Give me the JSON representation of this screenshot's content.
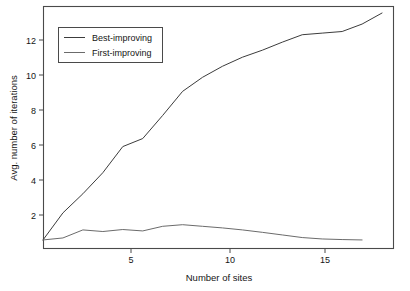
{
  "chart_data": {
    "type": "line",
    "title": "",
    "subtitle": "",
    "xlabel": "Number of sites",
    "ylabel": "Avg. number of iterations",
    "xlim": [
      1,
      18.6
    ],
    "ylim": [
      1.55,
      13.65
    ],
    "xticks": [
      5,
      10,
      15
    ],
    "xticklabels": [
      "5",
      "10",
      "15"
    ],
    "yticks": [
      2,
      4,
      6,
      8,
      10,
      12
    ],
    "yticklabels": [
      "2",
      "4",
      "6",
      "8",
      "10",
      "12"
    ],
    "grid": false,
    "legend_position": "upper left",
    "frame": "box",
    "series": [
      {
        "name": "Best-improving",
        "color": "#3c3c3c",
        "x": [
          1,
          2,
          3,
          4,
          5,
          6,
          7,
          8,
          9,
          10,
          11,
          12,
          13,
          14,
          15,
          16,
          17,
          18
        ],
        "values": [
          2.0,
          3.35,
          4.3,
          5.35,
          6.65,
          7.05,
          8.2,
          9.4,
          10.1,
          10.65,
          11.1,
          11.45,
          11.85,
          12.22,
          12.3,
          12.38,
          12.75,
          13.3
        ]
      },
      {
        "name": "First-improving",
        "color": "#6b6b6b",
        "x": [
          1,
          2,
          3,
          4,
          5,
          6,
          7,
          8,
          9,
          10,
          11,
          12,
          13,
          14,
          15,
          16,
          17
        ],
        "values": [
          2.0,
          2.1,
          2.5,
          2.42,
          2.52,
          2.45,
          2.68,
          2.76,
          2.68,
          2.6,
          2.5,
          2.38,
          2.25,
          2.12,
          2.05,
          2.02,
          2.0
        ]
      }
    ]
  },
  "legend": {
    "entries": [
      {
        "label": "Best-improving"
      },
      {
        "label": "First-improving"
      }
    ]
  },
  "axes": {
    "x_title": "Number of sites",
    "y_title": "Avg. number of iterations",
    "x_tick_labels": [
      "5",
      "10",
      "15"
    ],
    "y_tick_labels": [
      "2",
      "4",
      "6",
      "8",
      "10",
      "12"
    ]
  },
  "colors": {
    "background": "#ffffff",
    "frame": "#4a4a4a",
    "series_best": "#3c3c3c",
    "series_first": "#6b6b6b",
    "text": "#151515"
  }
}
